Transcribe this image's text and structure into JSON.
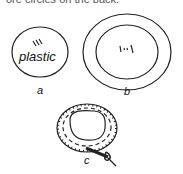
{
  "caption": "ore circles on the back.",
  "figures": [
    {
      "id": "a",
      "label": "a",
      "text": "plastic",
      "description": "single oval of plastic with hatch marks"
    },
    {
      "id": "b",
      "label": "b",
      "description": "two concentric ovals with hatch marks in center"
    },
    {
      "id": "c",
      "label": "c",
      "description": "ring with dashed stitch lines and needle/tool at bottom right"
    }
  ],
  "colors": {
    "stroke": "#222222",
    "background": "#ffffff"
  }
}
